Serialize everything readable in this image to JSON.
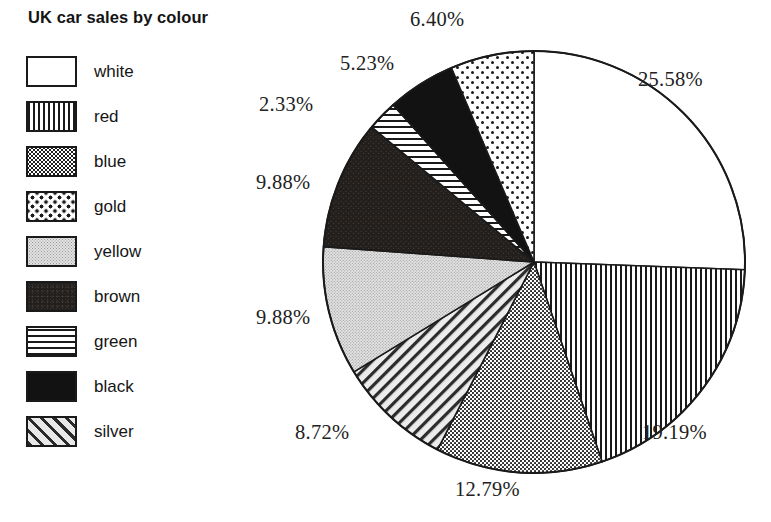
{
  "legend": {
    "title": "UK car sales by colour",
    "items": [
      {
        "label": "white",
        "pattern": "solid-white",
        "swatch_name": "swatch-white"
      },
      {
        "label": "red",
        "pattern": "vertical-stripes",
        "swatch_name": "swatch-red"
      },
      {
        "label": "blue",
        "pattern": "dense-dots",
        "swatch_name": "swatch-blue"
      },
      {
        "label": "gold",
        "pattern": "sparse-dots",
        "swatch_name": "swatch-gold"
      },
      {
        "label": "yellow",
        "pattern": "light-dots",
        "swatch_name": "swatch-yellow"
      },
      {
        "label": "brown",
        "pattern": "dark-speckle",
        "swatch_name": "swatch-brown"
      },
      {
        "label": "green",
        "pattern": "horizontal-stripes",
        "swatch_name": "swatch-green"
      },
      {
        "label": "black",
        "pattern": "solid-black",
        "swatch_name": "swatch-black"
      },
      {
        "label": "silver",
        "pattern": "diagonal-stripes",
        "swatch_name": "swatch-silver"
      }
    ]
  },
  "chart_data": {
    "type": "pie",
    "title": "UK car sales by colour",
    "xlabel": "",
    "ylabel": "",
    "start_angle_deg": 0,
    "direction": "clockwise",
    "value_unit": "percent",
    "labels_format": "NN.NN%",
    "slices": [
      {
        "name": "white",
        "value": 25.58,
        "label": "25.58%",
        "pattern": "solid-white"
      },
      {
        "name": "red",
        "value": 19.19,
        "label": "19.19%",
        "pattern": "vertical-stripes"
      },
      {
        "name": "blue",
        "value": 12.79,
        "label": "12.79%",
        "pattern": "dense-dots"
      },
      {
        "name": "silver",
        "value": 8.72,
        "label": "8.72%",
        "pattern": "diagonal-stripes"
      },
      {
        "name": "yellow",
        "value": 9.88,
        "label": "9.88%",
        "pattern": "light-dots"
      },
      {
        "name": "brown",
        "value": 9.88,
        "label": "9.88%",
        "pattern": "dark-speckle"
      },
      {
        "name": "green",
        "value": 2.33,
        "label": "2.33%",
        "pattern": "horizontal-stripes"
      },
      {
        "name": "black",
        "value": 5.23,
        "label": "5.23%",
        "pattern": "solid-black"
      },
      {
        "name": "gold",
        "value": 6.4,
        "label": "6.40%",
        "pattern": "sparse-dots"
      }
    ],
    "categories": [
      "white",
      "red",
      "blue",
      "silver",
      "yellow",
      "brown",
      "green",
      "black",
      "gold"
    ],
    "values": [
      25.58,
      19.19,
      12.79,
      8.72,
      9.88,
      9.88,
      2.33,
      5.23,
      6.4
    ],
    "legend_position": "left",
    "grid": false
  },
  "labels": {
    "white": "25.58%",
    "red": "19.19%",
    "blue": "12.79%",
    "silver": "8.72%",
    "yellow": "9.88%",
    "brown": "9.88%",
    "green": "2.33%",
    "black": "5.23%",
    "gold": "6.40%"
  },
  "colors": {
    "ink": "#1a1a1a",
    "background": "#ffffff",
    "black_slice": "#121212",
    "brown_slice": "#231f1d",
    "yellow_slice": "#e2e2e2"
  }
}
